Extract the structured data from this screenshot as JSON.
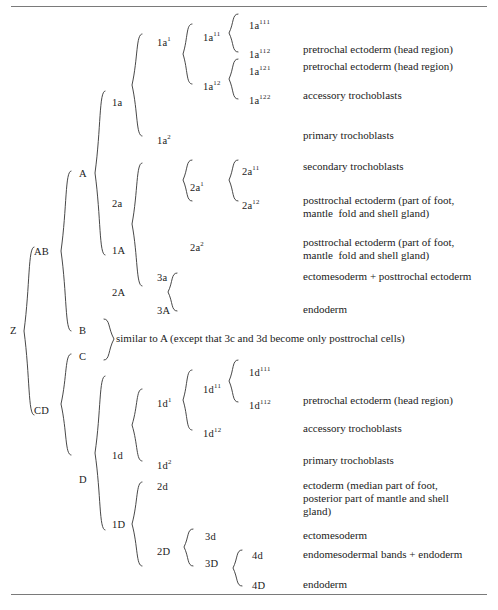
{
  "figure": {
    "title_rules": {
      "top": true,
      "bottom": true
    },
    "note": "similar to A (except that 3c and 3d become only posttrochal cells)"
  },
  "nodes": {
    "z": "Z",
    "ab": "AB",
    "cd": "CD",
    "a": "A",
    "b": "B",
    "c": "C",
    "d": "D",
    "a1": "1A",
    "a2": "2A",
    "d1": "1D",
    "d2": "2D",
    "la": "1a",
    "la1": "1a",
    "la1_sup": "1",
    "la2": "1a",
    "la2_sup": "2",
    "la11": "1a",
    "la11_sup": "11",
    "la12": "1a",
    "la12_sup": "12",
    "la111": "1a",
    "la111_sup": "111",
    "la112": "1a",
    "la112_sup": "112",
    "la121": "1a",
    "la121_sup": "121",
    "la122": "1a",
    "la122_sup": "122",
    "sa": "2a",
    "sa1": "2a",
    "sa1_sup": "1",
    "sa2": "2a",
    "sa2_sup": "2",
    "sa11": "2a",
    "sa11_sup": "11",
    "sa12": "2a",
    "sa12_sup": "12",
    "a3a": "3a",
    "a3A": "3A",
    "ld": "1d",
    "ld1": "1d",
    "ld1_sup": "1",
    "ld2": "1d",
    "ld2_sup": "2",
    "ld11": "1d",
    "ld11_sup": "11",
    "ld12": "1d",
    "ld12_sup": "12",
    "ld111": "1d",
    "ld111_sup": "111",
    "ld112": "1d",
    "ld112_sup": "112",
    "sd": "2d",
    "sd2": "2D",
    "d3d": "3d",
    "d3D": "3D",
    "d4d": "4d",
    "d4D": "4D"
  },
  "descriptions": {
    "la112": "pretrochal ectoderm (head region)",
    "la121": "pretrochal ectoderm (head region)",
    "la122": "accessory trochoblasts",
    "la2": "primary trochoblasts",
    "sa11": "secondary trochoblasts",
    "sa12": "posttrochal ectoderm (part of foot,\nmantle  fold and shell gland)",
    "sa2": "posttrochal ectoderm (part of foot,\nmantle  fold and shell gland)",
    "a3a": "ectomesoderm + posttrochal ectoderm",
    "a3A": "endoderm",
    "ld112": "pretrochal ectoderm (head region)",
    "ld12": "accessory trochoblasts",
    "ld2": "primary trochoblasts",
    "sd": "ectoderm (median part of foot,\nposterior part of mantle and shell\ngland)",
    "d3d": "ectomesoderm",
    "d4d": "endomesodermal bands + endoderm",
    "d4D": "endoderm"
  },
  "colors": {
    "ink": "#1b1b1b",
    "rule": "#7a7a7a",
    "brace": "#333333",
    "background": "#ffffff"
  }
}
